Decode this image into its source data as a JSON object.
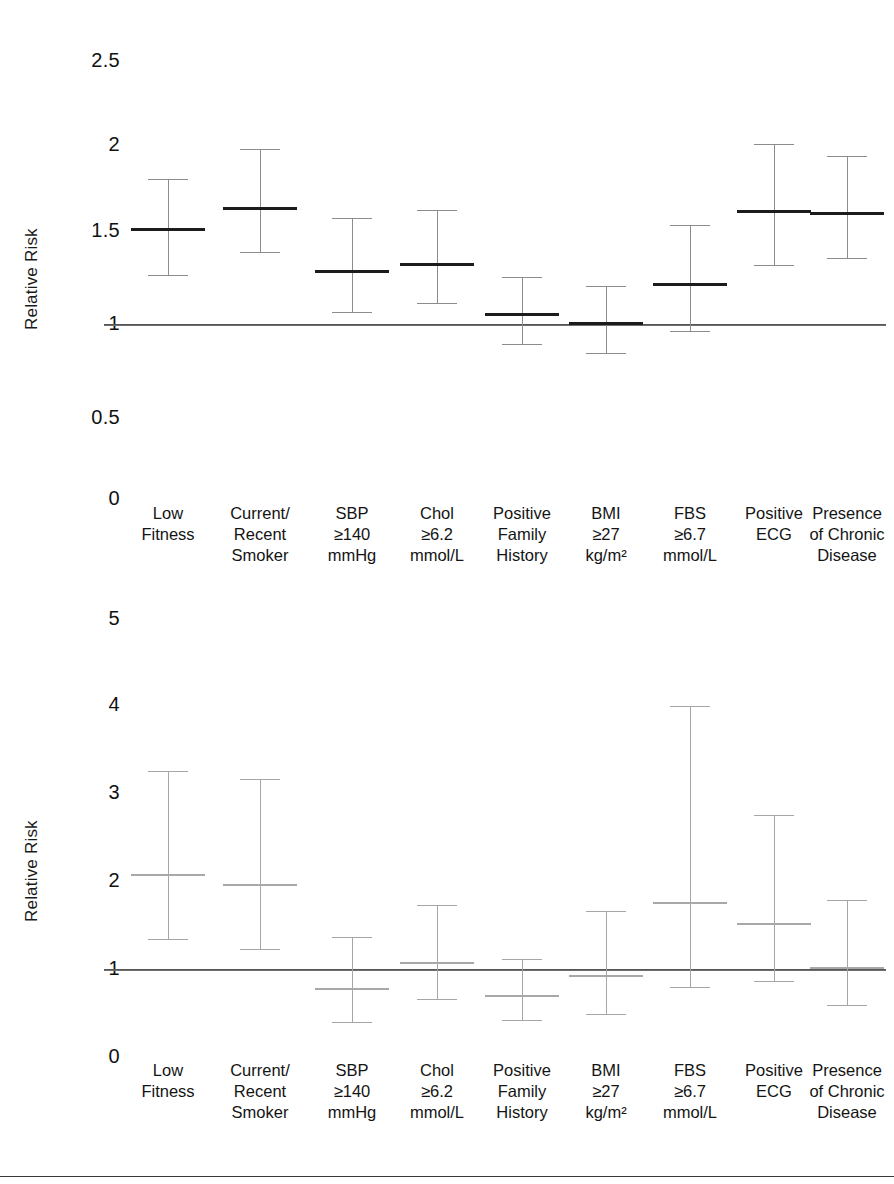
{
  "figure": {
    "width": 894,
    "height": 1184,
    "background": "#ffffff",
    "ink_color": "#1a1a1a",
    "whisker_color": "#8c8c8c",
    "marker_color": "#1c1c1c",
    "reference_line_color": "#5d5d5d"
  },
  "categories": [
    {
      "lines": [
        "Low",
        "Fitness"
      ]
    },
    {
      "lines": [
        "Current/",
        "Recent",
        "Smoker"
      ]
    },
    {
      "lines": [
        "SBP",
        "≥140",
        "mmHg"
      ]
    },
    {
      "lines": [
        "Chol",
        "≥6.2",
        "mmol/L"
      ]
    },
    {
      "lines": [
        "Positive",
        "Family",
        "History"
      ]
    },
    {
      "lines": [
        "BMI",
        "≥27",
        "kg/m²"
      ]
    },
    {
      "lines": [
        "FBS",
        "≥6.7",
        "mmol/L"
      ]
    },
    {
      "lines": [
        "Positive",
        "ECG"
      ]
    },
    {
      "lines": [
        "Presence",
        "of Chronic",
        "Disease"
      ]
    }
  ],
  "panels": {
    "top": {
      "ylabel": "Relative Risk",
      "yticks": [
        "2.5",
        "2",
        "1.5",
        "1",
        "0.5",
        "0"
      ]
    },
    "bottom": {
      "ylabel": "Relative Risk",
      "yticks": [
        "5",
        "4",
        "3",
        "2",
        "1",
        "0"
      ]
    }
  },
  "chart_data": [
    {
      "type": "scatter",
      "id": "top-forest-plot",
      "title": "",
      "xlabel": "",
      "ylabel": "Relative Risk",
      "ylim": [
        0,
        2.5
      ],
      "yticks": [
        0,
        0.5,
        1,
        1.5,
        2,
        2.5
      ],
      "grid": false,
      "legend": "none",
      "reference_line": 1,
      "categories": [
        "Low Fitness",
        "Current/Recent Smoker",
        "SBP ≥140 mmHg",
        "Chol ≥6.2 mmol/L",
        "Positive Family History",
        "BMI ≥27 kg/m2",
        "FBS ≥6.7 mmol/L",
        "Positive ECG",
        "Presence of Chronic Disease"
      ],
      "values": [
        1.52,
        1.64,
        1.29,
        1.33,
        1.06,
        1.01,
        1.22,
        1.62,
        1.61
      ],
      "ci_lower": [
        1.27,
        1.39,
        1.07,
        1.12,
        0.9,
        0.85,
        0.97,
        1.32,
        1.36
      ],
      "ci_upper": [
        1.81,
        1.98,
        1.58,
        1.63,
        1.26,
        1.21,
        1.54,
        2.01,
        1.94
      ]
    },
    {
      "type": "scatter",
      "id": "bottom-forest-plot",
      "title": "",
      "xlabel": "",
      "ylabel": "Relative Risk",
      "ylim": [
        0,
        5
      ],
      "yticks": [
        0,
        1,
        2,
        3,
        4,
        5
      ],
      "grid": false,
      "legend": "none",
      "reference_line": 1,
      "categories": [
        "Low Fitness",
        "Current/Recent Smoker",
        "SBP ≥140 mmHg",
        "Chol ≥6.2 mmol/L",
        "Positive Family History",
        "BMI ≥27 kg/m2",
        "FBS ≥6.7 mmol/L",
        "Positive ECG",
        "Presence of Chronic Disease"
      ],
      "values": [
        2.08,
        1.97,
        0.78,
        1.08,
        0.71,
        0.93,
        1.76,
        1.52,
        1.02
      ],
      "ci_lower": [
        1.35,
        1.24,
        0.41,
        0.67,
        0.43,
        0.5,
        0.81,
        0.87,
        0.6
      ],
      "ci_upper": [
        3.26,
        3.17,
        1.37,
        1.74,
        1.12,
        1.67,
        4.0,
        2.76,
        1.8
      ]
    }
  ]
}
